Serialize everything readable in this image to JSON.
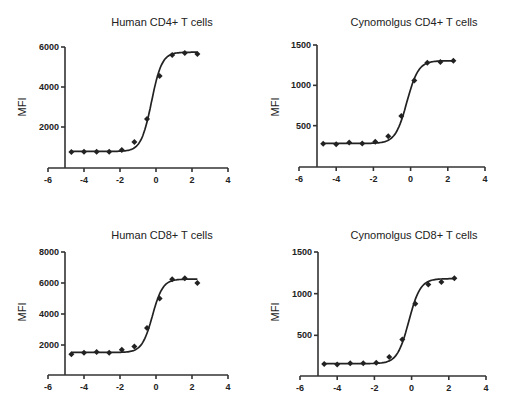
{
  "chart_data": [
    {
      "type": "scatter",
      "title": "Human CD4+ T cells",
      "xlabel": "",
      "ylabel": "MFI",
      "xlim": [
        -6,
        4
      ],
      "ylim": [
        0,
        6000
      ],
      "xticks": [
        -6,
        -4,
        -2,
        0,
        2,
        4
      ],
      "yticks": [
        2000,
        4000,
        6000
      ],
      "grid": false,
      "series": [
        {
          "name": "Human CD4+ T cells",
          "x": [
            -4.7,
            -4.0,
            -3.3,
            -2.6,
            -1.9,
            -1.2,
            -0.5,
            0.2,
            0.9,
            1.6,
            2.3
          ],
          "y": [
            750,
            760,
            760,
            760,
            850,
            1250,
            2400,
            4550,
            5600,
            5700,
            5650
          ],
          "fit": "sigmoidal",
          "fit_params": {
            "bottom": 780,
            "top": 5740,
            "ec50_log": -0.25,
            "hill": 1.5
          }
        }
      ]
    },
    {
      "type": "scatter",
      "title": "Cynomolgus CD4+ T cells",
      "xlabel": "",
      "ylabel": "MFI",
      "xlim": [
        -6,
        4
      ],
      "ylim": [
        0,
        1500
      ],
      "xticks": [
        -6,
        -4,
        -2,
        0,
        2,
        4
      ],
      "yticks": [
        500,
        1000,
        1500
      ],
      "grid": false,
      "series": [
        {
          "name": "Cynomolgus CD4+ T cells",
          "x": [
            -4.7,
            -4.0,
            -3.3,
            -2.6,
            -1.9,
            -1.2,
            -0.5,
            0.2,
            0.9,
            1.6,
            2.3
          ],
          "y": [
            275,
            270,
            290,
            280,
            300,
            370,
            620,
            1060,
            1280,
            1290,
            1305
          ],
          "fit": "sigmoidal",
          "fit_params": {
            "bottom": 280,
            "top": 1305,
            "ec50_log": -0.2,
            "hill": 1.4
          }
        }
      ]
    },
    {
      "type": "scatter",
      "title": "Human CD8+ T cells",
      "xlabel": "",
      "ylabel": "MFI",
      "xlim": [
        -6,
        4
      ],
      "ylim": [
        0,
        8000
      ],
      "xticks": [
        -6,
        -4,
        -2,
        0,
        2,
        4
      ],
      "yticks": [
        2000,
        4000,
        6000,
        8000
      ],
      "grid": false,
      "series": [
        {
          "name": "Human CD8+ T cells",
          "x": [
            -4.7,
            -4.0,
            -3.3,
            -2.6,
            -1.9,
            -1.2,
            -0.5,
            0.2,
            0.9,
            1.6,
            2.3
          ],
          "y": [
            1400,
            1500,
            1550,
            1500,
            1700,
            1900,
            3100,
            5000,
            6250,
            6300,
            6000
          ],
          "fit": "sigmoidal",
          "fit_params": {
            "bottom": 1520,
            "top": 6250,
            "ec50_log": -0.2,
            "hill": 1.5
          }
        }
      ]
    },
    {
      "type": "scatter",
      "title": "Cynomolgus CD8+ T cells",
      "xlabel": "",
      "ylabel": "MFI",
      "xlim": [
        -6,
        4
      ],
      "ylim": [
        0,
        1500
      ],
      "xticks": [
        -6,
        -4,
        -2,
        0,
        2,
        4
      ],
      "yticks": [
        500,
        1000,
        1500
      ],
      "grid": false,
      "series": [
        {
          "name": "Cynomolgus CD8+ T cells",
          "x": [
            -4.7,
            -4.0,
            -3.3,
            -2.6,
            -1.9,
            -1.2,
            -0.5,
            0.2,
            0.9,
            1.6,
            2.3
          ],
          "y": [
            155,
            150,
            165,
            165,
            170,
            240,
            450,
            880,
            1110,
            1140,
            1185
          ],
          "fit": "sigmoidal",
          "fit_params": {
            "bottom": 160,
            "top": 1180,
            "ec50_log": -0.15,
            "hill": 1.4
          }
        }
      ]
    }
  ],
  "panels": [
    {
      "title": "Human CD4+ T cells",
      "ylabel": "MFI"
    },
    {
      "title": "Cynomolgus CD4+ T cells",
      "ylabel": "MFI"
    },
    {
      "title": "Human CD8+ T cells",
      "ylabel": "MFI"
    },
    {
      "title": "Cynomolgus CD8+ T cells",
      "ylabel": "MFI"
    }
  ],
  "colors": {
    "ink": "#222222",
    "axis": "#333333",
    "background": "#ffffff"
  }
}
